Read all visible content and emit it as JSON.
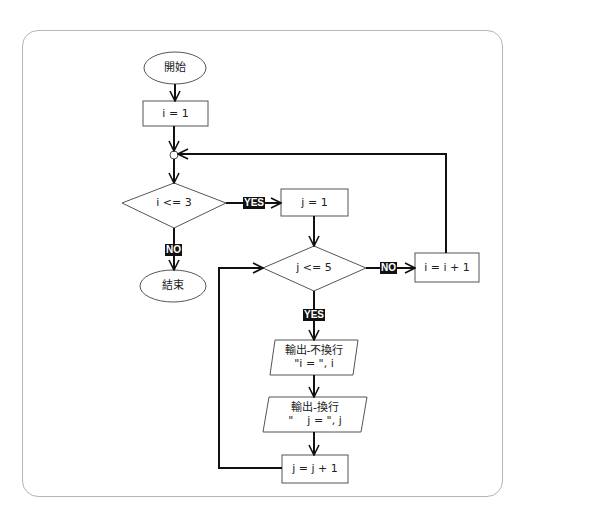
{
  "flowchart": {
    "start": {
      "label": "開始"
    },
    "init_i": {
      "label": "i = 1"
    },
    "cond_i": {
      "label": "i <= 3"
    },
    "yes_i": {
      "label": "YES"
    },
    "no_i": {
      "label": "NO"
    },
    "end": {
      "label": "結束"
    },
    "init_j": {
      "label": "j = 1"
    },
    "cond_j": {
      "label": "j <= 5"
    },
    "no_j": {
      "label": "NO"
    },
    "yes_j": {
      "label": "YES"
    },
    "inc_i": {
      "label": "i = i + 1"
    },
    "output1": {
      "line1": "輸出-不換行",
      "line2": "\"i = \", i"
    },
    "output2": {
      "line1": "輸出-換行",
      "line2": "\"    j = \", j"
    },
    "inc_j": {
      "label": "j = j + 1"
    }
  },
  "colors": {
    "line": "#111111",
    "shape_stroke": "#555555",
    "frame": "#b5b5b5",
    "tag_bg": "#111111",
    "tag_fg": "#ffffff"
  }
}
